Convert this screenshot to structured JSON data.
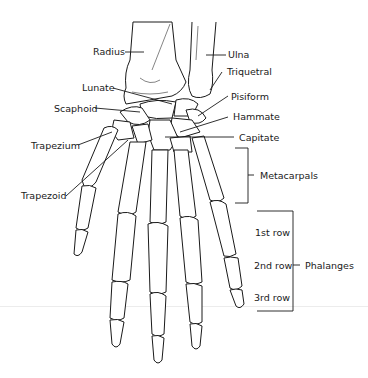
{
  "diagram": {
    "labels": {
      "radius": "Radius",
      "ulna": "Ulna",
      "triquetral": "Triquetral",
      "lunate": "Lunate",
      "pisiform": "Pisiform",
      "scaphoid": "Scaphoid",
      "hammate": "Hammate",
      "capitate": "Capitate",
      "trapezium": "Trapezium",
      "trapezoid": "Trapezoid",
      "metacarpals": "Metacarpals",
      "phalanges": "Phalanges",
      "row1": "1st row",
      "row2": "2nd row",
      "row3": "3rd row"
    },
    "colors": {
      "line": "#1a1a1a",
      "background": "#ffffff"
    }
  }
}
